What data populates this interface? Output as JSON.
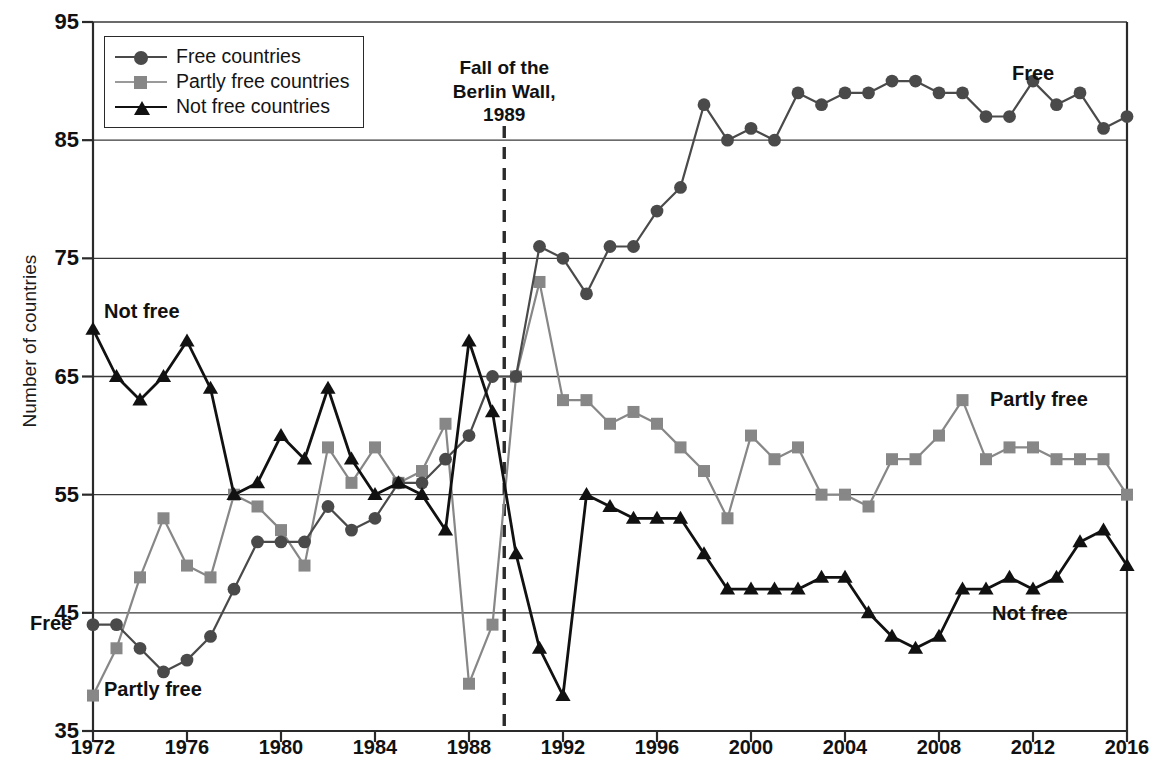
{
  "chart_data": {
    "type": "line",
    "title": "",
    "xlabel": "",
    "ylabel": "Number of countries",
    "xlim": [
      1972,
      2016
    ],
    "ylim": [
      35,
      95
    ],
    "grid": "horizontal",
    "legend_position": "top-left",
    "x": [
      1972,
      1973,
      1974,
      1975,
      1976,
      1977,
      1978,
      1979,
      1980,
      1981,
      1982,
      1983,
      1984,
      1985,
      1986,
      1987,
      1988,
      1989,
      1990,
      1991,
      1992,
      1993,
      1994,
      1995,
      1996,
      1997,
      1998,
      1999,
      2000,
      2001,
      2002,
      2003,
      2004,
      2005,
      2006,
      2007,
      2008,
      2009,
      2010,
      2011,
      2012,
      2013,
      2014,
      2015,
      2016
    ],
    "xtick_labels": [
      "1972",
      "1976",
      "1980",
      "1984",
      "1988",
      "1992",
      "1996",
      "2000",
      "2004",
      "2008",
      "2012",
      "2016"
    ],
    "ytick_labels": [
      "35",
      "45",
      "55",
      "65",
      "75",
      "85",
      "95"
    ],
    "series": [
      {
        "name": "Free countries",
        "key": "free",
        "marker": "circle",
        "color": "#4a4a4a",
        "label": "Free",
        "values": [
          44,
          44,
          42,
          40,
          41,
          43,
          47,
          51,
          51,
          51,
          54,
          52,
          53,
          56,
          56,
          58,
          60,
          65,
          65,
          76,
          75,
          72,
          76,
          76,
          79,
          81,
          88,
          85,
          86,
          85,
          89,
          88,
          89,
          89,
          90,
          90,
          89,
          89,
          87,
          87,
          90,
          88,
          89,
          86,
          87
        ]
      },
      {
        "name": "Partly free countries",
        "key": "partly_free",
        "marker": "square",
        "color": "#878787",
        "label": "Partly free",
        "values": [
          38,
          42,
          48,
          53,
          49,
          48,
          55,
          54,
          52,
          49,
          59,
          56,
          59,
          56,
          57,
          61,
          39,
          44,
          65,
          73,
          63,
          63,
          61,
          62,
          61,
          59,
          57,
          53,
          60,
          58,
          59,
          55,
          55,
          54,
          58,
          58,
          60,
          63,
          58,
          59,
          59,
          58,
          58,
          58,
          55
        ]
      },
      {
        "name": "Not free countries",
        "key": "not_free",
        "marker": "triangle",
        "color": "#111111",
        "label": "Not free",
        "values": [
          69,
          65,
          63,
          65,
          68,
          64,
          55,
          56,
          60,
          58,
          64,
          58,
          55,
          56,
          55,
          52,
          68,
          62,
          50,
          42,
          38,
          55,
          54,
          53,
          53,
          53,
          50,
          47,
          47,
          47,
          47,
          48,
          48,
          45,
          43,
          42,
          43,
          47,
          47,
          48,
          47,
          48,
          51,
          52,
          49
        ]
      }
    ],
    "annotation": {
      "text": "Fall of the\nBerlin Wall,\n1989",
      "line_x": 1989.5,
      "style": "dashed-vertical"
    }
  }
}
